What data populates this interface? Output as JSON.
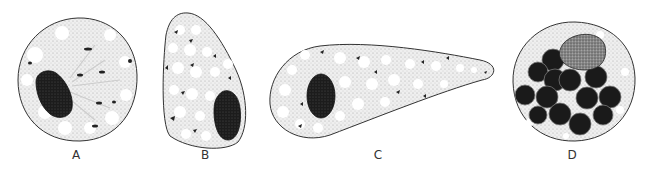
{
  "figure": {
    "panels": [
      {
        "label": "A",
        "description": "Round cell with dark oval nucleus at left and radiating cytoplasmic strands"
      },
      {
        "label": "B",
        "description": "Pear-shaped cell with vacuolated cytoplasm and dark nucleus at lower right"
      },
      {
        "label": "C",
        "description": "Elongated teardrop-shaped cell with vacuolated cytoplasm and dark oval nucleus at left"
      },
      {
        "label": "D",
        "description": "Round cell filled with many dark spherical bodies and a stippled cap at top"
      }
    ],
    "colors": {
      "outline": "#333333",
      "cytoplasm": "#e8e8e8",
      "nucleus": "#1a1a1a",
      "vacuole": "#ffffff"
    }
  }
}
